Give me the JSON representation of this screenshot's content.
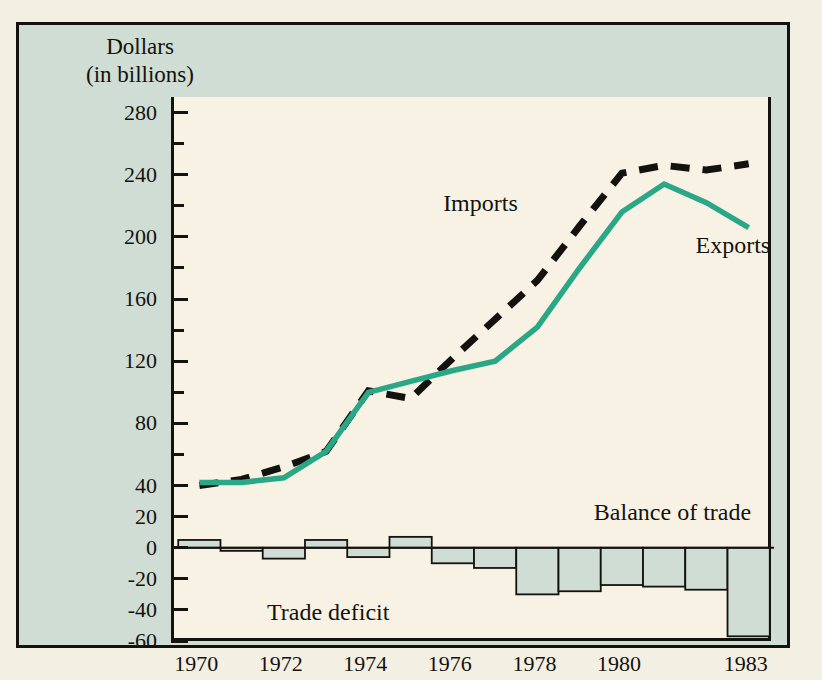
{
  "figure": {
    "axis_title_line1": "Dollars",
    "axis_title_line2": "(in billions)",
    "background_color": "#cfddd4",
    "panel_color": "#f7f2e4",
    "page_color": "#f3efe2",
    "frame_color": "#14120f"
  },
  "annotations": {
    "imports_label": "Imports",
    "exports_label": "Exports",
    "balance_label": "Balance of trade",
    "deficit_label": "Trade deficit"
  },
  "chart_data": {
    "type": "line",
    "title": "Dollars (in billions)",
    "subtitle": "",
    "xlabel": "",
    "ylabel": "Dollars (in billions)",
    "x": [
      1970,
      1971,
      1972,
      1973,
      1974,
      1975,
      1976,
      1977,
      1978,
      1979,
      1980,
      1981,
      1982,
      1983
    ],
    "xticklabels": [
      "1970",
      "1972",
      "1974",
      "1976",
      "1978",
      "1980",
      "1983"
    ],
    "xtickvalues": [
      1970,
      1972,
      1974,
      1976,
      1978,
      1980,
      1983
    ],
    "xlim": [
      1969.4,
      1983.6
    ],
    "ylim": [
      -60,
      290
    ],
    "yticklabels": [
      "280",
      "240",
      "200",
      "160",
      "120",
      "80",
      "40",
      "20",
      "0",
      "-20",
      "-40",
      "-60"
    ],
    "ytickvalues": [
      280,
      240,
      200,
      160,
      120,
      80,
      40,
      20,
      0,
      -20,
      -40,
      -60
    ],
    "yminorticks": [
      260,
      220,
      180,
      140,
      100,
      60
    ],
    "grid": false,
    "legend_position": "inline-annotation",
    "series": [
      {
        "name": "Imports",
        "style": "dashed",
        "color": "#14120f",
        "values": [
          40,
          44,
          52,
          62,
          101,
          96,
          122,
          147,
          172,
          207,
          241,
          246,
          243,
          247
        ]
      },
      {
        "name": "Exports",
        "style": "solid",
        "color": "#2aa786",
        "values": [
          42,
          42,
          45,
          62,
          100,
          107,
          114,
          120,
          142,
          180,
          216,
          234,
          222,
          206
        ]
      }
    ],
    "bars": {
      "name": "Balance of trade",
      "fill_color": "#cfddd4",
      "edge_color": "#14120f",
      "values": [
        5,
        -2,
        -7,
        5,
        -6,
        7,
        -10,
        -13,
        -30,
        -28,
        -24,
        -25,
        -27,
        -57
      ]
    }
  }
}
